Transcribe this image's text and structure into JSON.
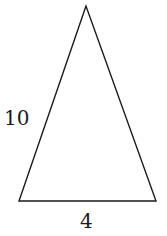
{
  "figure": {
    "shape": "isosceles-triangle",
    "stroke_color": "#1a1a1a",
    "background": "#ffffff",
    "vertices": {
      "apex": [
        86,
        6
      ],
      "bottom_left": [
        19,
        201
      ],
      "bottom_right": [
        156,
        201
      ]
    },
    "labels": {
      "left_side": "10",
      "base": "4"
    }
  }
}
